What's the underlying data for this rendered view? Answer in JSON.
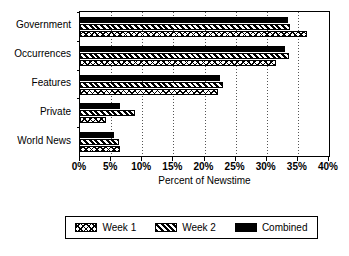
{
  "chart_data": {
    "type": "bar",
    "orientation": "horizontal",
    "title": "",
    "xlabel": "Percent of Newstime",
    "ylabel": "",
    "xlim": [
      0,
      40
    ],
    "xticks": [
      "0%",
      "5%",
      "10%",
      "15%",
      "20%",
      "25%",
      "30%",
      "35%",
      "40%"
    ],
    "xtick_values": [
      0,
      5,
      10,
      15,
      20,
      25,
      30,
      35,
      40
    ],
    "grid": "vertical-dotted",
    "legend_position": "below-outside",
    "categories": [
      "Government",
      "Occurrences",
      "Features",
      "Private",
      "World News"
    ],
    "series": [
      {
        "name": "Week 1",
        "pattern": "cross-hatch",
        "values": [
          36.5,
          31.5,
          22.1,
          4.2,
          6.4
        ]
      },
      {
        "name": "Week 2",
        "pattern": "diagonal-hatch",
        "values": [
          33.8,
          33.5,
          23.0,
          8.8,
          6.2
        ]
      },
      {
        "name": "Combined",
        "pattern": "solid-black",
        "values": [
          33.4,
          33.0,
          22.5,
          6.5,
          5.4
        ]
      }
    ]
  },
  "legend": {
    "items": [
      {
        "label": "Week 1",
        "swatch": "week1"
      },
      {
        "label": "Week 2",
        "swatch": "week2"
      },
      {
        "label": "Combined",
        "swatch": "combined"
      }
    ]
  },
  "colors": {
    "ink": "#000000",
    "paper": "#ffffff",
    "grid": "#555555"
  }
}
